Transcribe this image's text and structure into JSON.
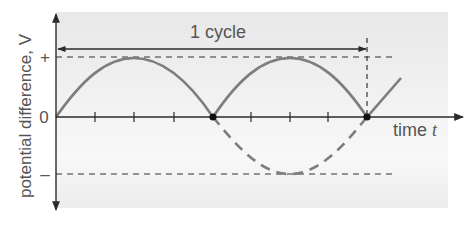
{
  "diagram": {
    "cycle_label": "1 cycle",
    "y_axis_label": "potential difference, V",
    "x_axis_label": "time",
    "x_axis_symbol": "t",
    "y_ticks": {
      "positive": "+",
      "zero": "0",
      "negative": "–"
    },
    "colors": {
      "background_top": "#e8e8e8",
      "background_bottom": "#f7f7f7",
      "axis": "#2b2b2b",
      "curve": "#7d7d7d",
      "text": "#555555",
      "guide": "#333333"
    },
    "curve": {
      "solid_segments": "positive half-cycles drawn solid",
      "dashed_segment": "negative half-cycle drawn dashed"
    }
  }
}
